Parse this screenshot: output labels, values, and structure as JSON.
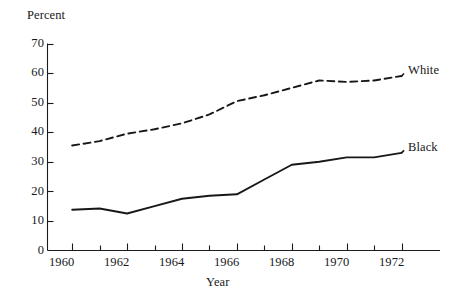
{
  "chart_data": {
    "type": "line",
    "title": "",
    "subtitle": "",
    "xlabel": "Year",
    "ylabel": "Percent",
    "xlim": [
      1959.1,
      1973.4
    ],
    "ylim": [
      0,
      70
    ],
    "grid": false,
    "legend_position": "right-inline-labels",
    "x_ticks_major": [
      1960,
      1962,
      1964,
      1966,
      1968,
      1970,
      1972
    ],
    "x_ticks_minor": [
      1961,
      1963,
      1965,
      1967,
      1969,
      1971
    ],
    "x_tick_labels": [
      "1960",
      "1962",
      "1964",
      "1966",
      "1968",
      "1970",
      "1972"
    ],
    "y_ticks": [
      0,
      10,
      20,
      30,
      40,
      50,
      60,
      70
    ],
    "y_tick_labels": [
      "0",
      "10",
      "20",
      "30",
      "40",
      "50",
      "60",
      "70"
    ],
    "x": [
      1960,
      1961,
      1962,
      1963,
      1964,
      1965,
      1966,
      1967,
      1968,
      1969,
      1970,
      1971,
      1972
    ],
    "series": [
      {
        "name": "White",
        "style": "dashed",
        "color": "#16181a",
        "values": [
          35.5,
          37.0,
          39.5,
          41.0,
          43.0,
          46.0,
          50.5,
          52.5,
          55.0,
          57.5,
          57.0,
          57.5,
          59.0
        ]
      },
      {
        "name": "Black",
        "style": "solid",
        "color": "#16181a",
        "values": [
          13.8,
          14.2,
          12.5,
          15.0,
          17.5,
          18.5,
          19.0,
          24.0,
          29.0,
          30.0,
          31.5,
          31.5,
          33.0
        ]
      }
    ]
  },
  "labels": {
    "y_axis_title": "Percent",
    "x_axis_title": "Year",
    "series_white": "White",
    "series_black": "Black"
  }
}
